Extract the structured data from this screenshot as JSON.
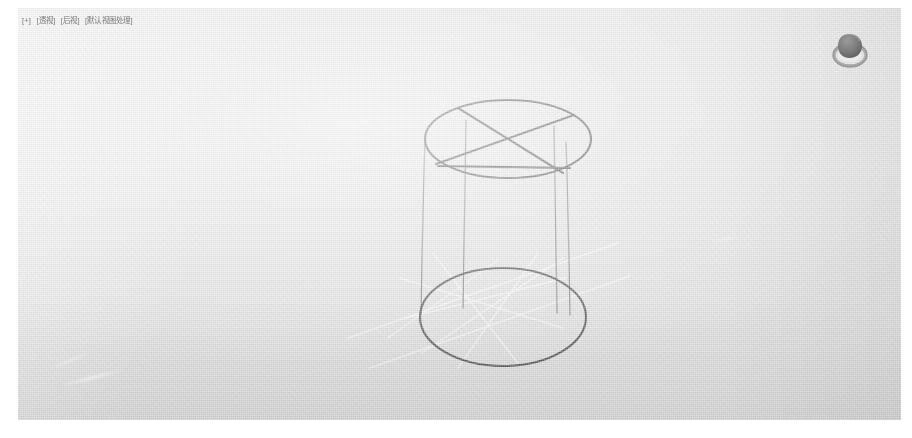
{
  "window": {
    "app": "3D Viewport",
    "background_color": "#e3e3e3",
    "paper_color": "#ffffff"
  },
  "viewport": {
    "overlay_text": {
      "full": "[+] [透视] [后视] [默认视图处理]",
      "segments": [
        "[+]",
        "[透视]",
        "[后视]",
        "[默认视图处理]"
      ],
      "color": "#6d6d6d"
    },
    "nav_gizmo": {
      "name": "view-navigation-gizmo",
      "body_color": "#7d7d7d",
      "ring_color": "#cfcfcf"
    }
  },
  "scene": {
    "object": {
      "name": "Cylinder",
      "display_mode": "wireframe",
      "edge_color": "#3a3a3a",
      "hidden_edge_color": "#f4f4f4",
      "top_cap": {
        "center_x": 490,
        "center_y": 131,
        "radius_x": 83,
        "radius_y": 39
      },
      "bottom_cap": {
        "center_x": 485,
        "center_y": 309,
        "radius_x": 83,
        "radius_y": 49
      },
      "side_edges_x": [
        407,
        448,
        536,
        548
      ],
      "height_px": 178
    }
  }
}
